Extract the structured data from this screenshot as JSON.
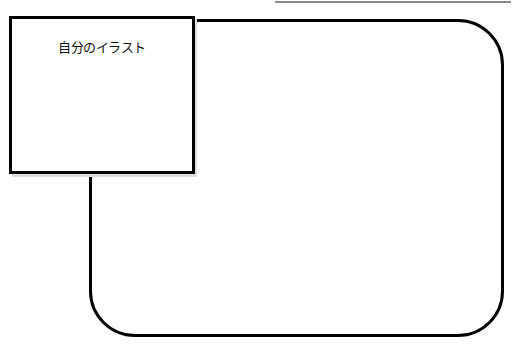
{
  "diagram": {
    "illustration_box": {
      "label": "自分のイラスト"
    },
    "colors": {
      "stroke": "#000000",
      "background": "#ffffff",
      "rule": "#8a8a8a"
    }
  }
}
